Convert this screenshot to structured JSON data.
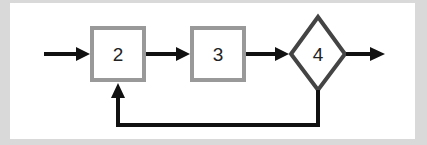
{
  "diagram": {
    "nodes": [
      {
        "id": "node-2",
        "shape": "rectangle",
        "label": "2"
      },
      {
        "id": "node-3",
        "shape": "rectangle",
        "label": "3"
      },
      {
        "id": "node-4",
        "shape": "diamond",
        "label": "4"
      }
    ],
    "edges": [
      {
        "from": "input",
        "to": "node-2"
      },
      {
        "from": "node-2",
        "to": "node-3"
      },
      {
        "from": "node-3",
        "to": "node-4"
      },
      {
        "from": "node-4",
        "to": "output"
      },
      {
        "from": "node-4",
        "to": "node-2",
        "type": "feedback"
      }
    ],
    "colors": {
      "box_border": "#999999",
      "diamond_border": "#444444",
      "arrow": "#111111",
      "background": "#ffffff",
      "frame": "#d9d9d9"
    }
  }
}
